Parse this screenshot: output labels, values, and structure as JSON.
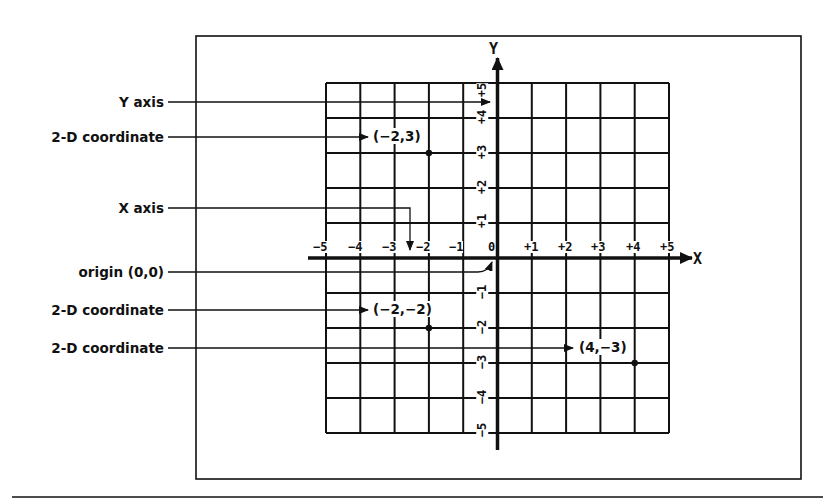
{
  "figure": {
    "colors": {
      "ink": "#111111",
      "paper": "#ffffff"
    },
    "frame": {
      "x": 196,
      "y": 36,
      "w": 605,
      "h": 443
    },
    "bottom_rule_y": 497,
    "grid": {
      "x0": 326,
      "y0": 83,
      "cols": 10,
      "rows": 10,
      "cell_w": 34.3,
      "cell_h": 35,
      "origin_col": 5,
      "origin_row": 5
    },
    "axes": {
      "x_name": "X",
      "y_name": "Y",
      "x_ticks": [
        "−5",
        "−4",
        "−3",
        "−2",
        "−1",
        "0",
        "+1",
        "+2",
        "+3",
        "+4",
        "+5"
      ],
      "y_ticks_positive": [
        "+1",
        "+2",
        "+3",
        "+4",
        "+5"
      ],
      "y_ticks_negative": [
        "−1",
        "−2",
        "−3",
        "−4",
        "−5"
      ]
    },
    "callouts": [
      {
        "id": "y-axis",
        "label": "Y axis",
        "label_y": 102
      },
      {
        "id": "point-1",
        "label": "2-D coordinate",
        "label_y": 137
      },
      {
        "id": "x-axis",
        "label": "X axis",
        "label_y": 208
      },
      {
        "id": "origin",
        "label": "origin (0,0)",
        "label_y": 272
      },
      {
        "id": "point-2",
        "label": "2-D coordinate",
        "label_y": 310
      },
      {
        "id": "point-3",
        "label": "2-D coordinate",
        "label_y": 348
      }
    ],
    "points": [
      {
        "id": "point-1",
        "x": -2,
        "y": 3,
        "text": "(−2,3)"
      },
      {
        "id": "point-2",
        "x": -2,
        "y": -2,
        "text": "(−2,−2)"
      },
      {
        "id": "point-3",
        "x": 4,
        "y": -3,
        "text": "(4,−3)"
      }
    ]
  }
}
